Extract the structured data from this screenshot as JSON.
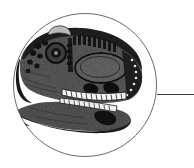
{
  "figure": {
    "title": "Theropod dinosaur skull in circular vignette",
    "caption": "Lateral view of a carnosaur skull enclosed in a thin circular frame with a leader line extending to the right edge",
    "background_color": "#ffffff",
    "canvas": {
      "width": 194,
      "height": 168
    }
  },
  "circle_frame": {
    "name": "circular vignette outline",
    "center_x": 85,
    "center_y": 85,
    "radius": 72,
    "stroke_color": "#6b6b6b",
    "stroke_width": 1,
    "fill": "none"
  },
  "leader_line": {
    "name": "leader line",
    "x1": 157,
    "y1": 94,
    "x2": 194,
    "y2": 94,
    "stroke_color": "#3a3a3a",
    "stroke_width": 1
  },
  "skull": {
    "name": "dinosaur skull illustration",
    "orientation": "facing left",
    "ink_color": "#1b1b1b",
    "midtone_color": "#7a7a7a",
    "shadow_color": "#404040",
    "highlight_color": "#f2f2f2",
    "bounds": {
      "x": 13,
      "y": 28,
      "width": 130,
      "height": 106
    },
    "parts": [
      {
        "label": "cranial roof",
        "tone": "#2a2a2a"
      },
      {
        "label": "nasal crest",
        "tone": "#9a9a9a"
      },
      {
        "label": "antorbital fenestra",
        "tone": "#555555"
      },
      {
        "label": "orbit",
        "tone": "#141414"
      },
      {
        "label": "naris",
        "tone": "#1a1a1a"
      },
      {
        "label": "maxillary tooth row",
        "tone": "#f4f4f4"
      },
      {
        "label": "dentary tooth row",
        "tone": "#efefef"
      },
      {
        "label": "lower jaw",
        "tone": "#6e6e6e"
      },
      {
        "label": "quadrate region",
        "tone": "#3c3c3c"
      }
    ]
  }
}
